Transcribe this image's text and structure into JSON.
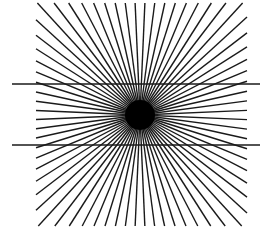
{
  "figure": {
    "name": "Hering illusion",
    "background": "#ffffff",
    "stroke_color": "#1a1a1a",
    "center": [
      140,
      115
    ],
    "ray_count": 72,
    "ray_box": {
      "x1": 36,
      "y1": 3,
      "x2": 247,
      "y2": 226
    },
    "ray_width": 1.4,
    "center_disk_radius": 15,
    "horizontal_lines": [
      {
        "y": 84,
        "x1": 12,
        "x2": 260
      },
      {
        "y": 145,
        "x1": 12,
        "x2": 260
      }
    ],
    "horizontal_width": 1.3
  }
}
